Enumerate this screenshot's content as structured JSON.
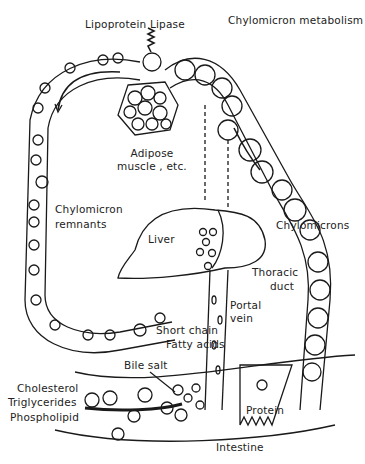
{
  "title": "Chylomicron metabolism",
  "labels": {
    "lipoprotein_lipase": "Lipoprotein Lipase",
    "adipose_line1": "Adipose",
    "adipose_line2": "muscle , etc.",
    "chylomicron_remnants_line1": "Chylomicron",
    "chylomicron_remnants_line2": "remnants",
    "liver": "Liver",
    "chylomicrons": "Chylomicrons",
    "thoracic_line1": "Thoracic",
    "thoracic_line2": "duct",
    "portal_line1": "Portal",
    "portal_line2": "vein",
    "short_chain_line1": "Short chain",
    "short_chain_line2": "Fatty acids",
    "bile_salt": "Bile salt",
    "cholesterol": "Cholesterol",
    "triglycerides": "Triglycerides",
    "phospholipid": "Phospholipid",
    "protein": "Protein",
    "intestine": "Intestine"
  },
  "colors": {
    "line": "#1a1a1a",
    "background": "#ffffff"
  }
}
